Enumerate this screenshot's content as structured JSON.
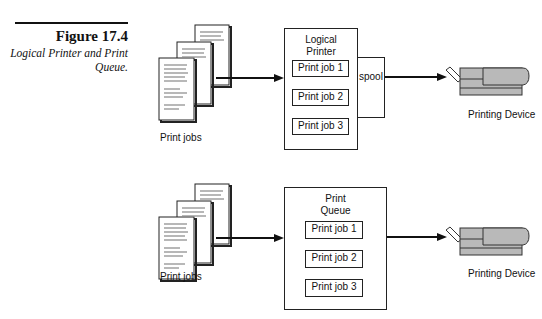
{
  "caption": {
    "number": "Figure 17.4",
    "text": "Logical Printer and Print Queue."
  },
  "top_diagram": {
    "source_label": "Print jobs",
    "container_title_line1": "Logical",
    "container_title_line2": "Printer",
    "jobs": [
      "Print job 1",
      "Print job 2",
      "Print job 3"
    ],
    "spool_label": "spool",
    "device_label": "Printing Device"
  },
  "bottom_diagram": {
    "source_label": "Print jobs",
    "container_title_line1": "Print",
    "container_title_line2": "Queue",
    "jobs": [
      "Print job 1",
      "Print job 2",
      "Print job 3"
    ],
    "device_label": "Printing Device"
  },
  "colors": {
    "printer_fill": "#b9b9b9",
    "stroke": "#222222"
  }
}
